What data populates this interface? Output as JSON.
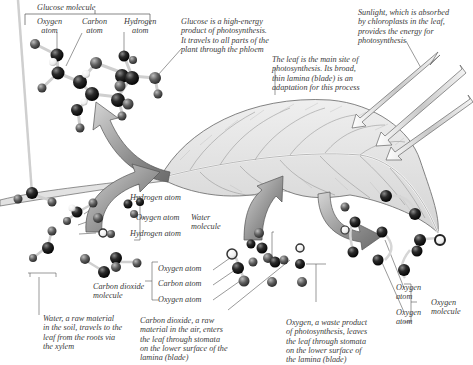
{
  "diagram": {
    "colors": {
      "background": "#ffffff",
      "text": "#3a3a3a",
      "leader_lines": "#555555",
      "atom_dark": "#1a1a1a",
      "atom_mid": "#555555",
      "atom_light": "#f2f2f2",
      "leaf_fill": "#e8e8e8",
      "leaf_vein": "#8a8a8a",
      "arrow_fill": "#9a9a9a",
      "sunlight_fill": "#d8d8d8"
    },
    "glucose": {
      "title": "Glucose molecule",
      "oxygen_label": "Oxygen\natom",
      "carbon_label": "Carbon\natom",
      "hydrogen_label": "Hydrogen\natom",
      "caption": "Glucose is a high-energy\nproduct of photosynthesis.\nIt travels to all parts of the\nplant through the phloem"
    },
    "sunlight": {
      "caption": "Sunlight, which is absorbed\nby chloroplasts in the leaf,\nprovides the energy for\nphotosynthesis"
    },
    "leaf": {
      "caption": "The leaf is the main site of\nphotosynthesis. Its broad,\nthin lamina (blade) is an\nadaptation for this process"
    },
    "water_molecule": {
      "hydrogen_label_1": "Hydrogen atom",
      "oxygen_label": "Oxygen atom",
      "hydrogen_label_2": "Hydrogen atom",
      "group_label": "Water\nmolecule",
      "caption": "Water, a raw material\nin the soil, travels to the\nleaf from the roots via\nthe xylem"
    },
    "carbon_dioxide": {
      "molecule_label": "Carbon dioxide\nmolecule",
      "oxygen_label_1": "Oxygen atom",
      "carbon_label": "Carbon atom",
      "oxygen_label_2": "Oxygen atom",
      "caption": "Carbon dioxide, a raw\nmaterial in the air, enters\nthe leaf through stomata\non the lower surface of the\nlamina (blade)"
    },
    "oxygen": {
      "atom_label_1": "Oxygen\natom",
      "atom_label_2": "Oxygen\natom",
      "molecule_label": "Oxygen\nmolecule",
      "caption": "Oxygen, a waste product\nof photosynthesis, leaves\nthe leaf through stomata\non the lower surface of\nthe lamina (blade)"
    }
  }
}
